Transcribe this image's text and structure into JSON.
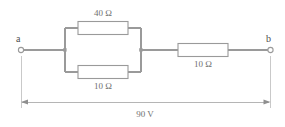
{
  "figure": {
    "type": "circuit-diagram",
    "width": 285,
    "height": 127,
    "background_color": "#ffffff",
    "line_color": "#9a9a9a",
    "text_color": "#6f6f6f"
  },
  "terminals": {
    "left_label": "a",
    "right_label": "b"
  },
  "components": [
    {
      "id": "r-top",
      "kind": "resistor",
      "label": "40 Ω",
      "value": 40,
      "unit": "Ω",
      "branch": "parallel-top",
      "label_position": "above"
    },
    {
      "id": "r-bottom",
      "kind": "resistor",
      "label": "10 Ω",
      "value": 10,
      "unit": "Ω",
      "branch": "parallel-bottom",
      "label_position": "below"
    },
    {
      "id": "r-series",
      "kind": "resistor",
      "label": "10 Ω",
      "value": 10,
      "unit": "Ω",
      "branch": "series-right",
      "label_position": "below"
    }
  ],
  "source": {
    "label": "90 V",
    "value": 90,
    "unit": "V",
    "span": "a-to-b"
  }
}
